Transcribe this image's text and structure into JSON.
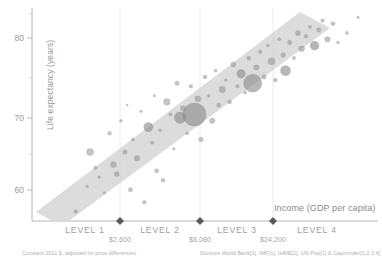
{
  "chart_data": {
    "type": "scatter",
    "title": "",
    "xlabel": "Income (GDP per capita)",
    "ylabel": "Life expectancy (years)",
    "xscale": "log",
    "xlim": [
      300,
      120000
    ],
    "ylim": [
      52,
      86
    ],
    "grid": false,
    "legend": "none",
    "yticks": [
      60,
      70,
      80
    ],
    "ytick_labels": [
      "60",
      "70",
      "80"
    ],
    "minor_yticks": [
      55,
      65,
      75,
      85
    ],
    "income_levels": [
      {
        "label": "LEVEL 1",
        "boundary_value": "$2,600",
        "boundary_x": 2600
      },
      {
        "label": "LEVEL 2",
        "boundary_value": "$8,080",
        "boundary_x": 8080
      },
      {
        "label": "LEVEL 3",
        "boundary_value": "$24,200",
        "boundary_x": 24200
      },
      {
        "label": "LEVEL 4",
        "boundary_value": "",
        "boundary_x": null
      }
    ],
    "trend_band": {
      "description": "diagonal grey band showing positive correlation between income and life expectancy",
      "color": "#c9c9c9"
    },
    "bubble_encoding": {
      "size": "population",
      "color": "#8a8a8a"
    },
    "points": [
      {
        "x": 640,
        "y": 53.5,
        "r": 2.0
      },
      {
        "x": 780,
        "y": 57.5,
        "r": 1.4
      },
      {
        "x": 820,
        "y": 63.0,
        "r": 3.6
      },
      {
        "x": 900,
        "y": 60.5,
        "r": 1.8
      },
      {
        "x": 960,
        "y": 59.0,
        "r": 1.3
      },
      {
        "x": 1050,
        "y": 56.5,
        "r": 1.2
      },
      {
        "x": 1150,
        "y": 66.0,
        "r": 2.0
      },
      {
        "x": 1230,
        "y": 61.0,
        "r": 3.0
      },
      {
        "x": 1300,
        "y": 59.5,
        "r": 2.6
      },
      {
        "x": 1400,
        "y": 68.0,
        "r": 1.5
      },
      {
        "x": 1500,
        "y": 63.0,
        "r": 2.4
      },
      {
        "x": 1560,
        "y": 70.5,
        "r": 1.1
      },
      {
        "x": 1650,
        "y": 57.0,
        "r": 2.2
      },
      {
        "x": 1720,
        "y": 65.0,
        "r": 1.6
      },
      {
        "x": 1850,
        "y": 62.0,
        "r": 2.8
      },
      {
        "x": 1980,
        "y": 69.5,
        "r": 1.4
      },
      {
        "x": 2100,
        "y": 55.0,
        "r": 1.9
      },
      {
        "x": 2250,
        "y": 67.0,
        "r": 4.6
      },
      {
        "x": 2400,
        "y": 64.5,
        "r": 1.7
      },
      {
        "x": 2500,
        "y": 72.0,
        "r": 1.3
      },
      {
        "x": 2600,
        "y": 60.0,
        "r": 2.1
      },
      {
        "x": 2750,
        "y": 66.5,
        "r": 1.5
      },
      {
        "x": 2900,
        "y": 58.5,
        "r": 2.0
      },
      {
        "x": 3100,
        "y": 71.0,
        "r": 3.4
      },
      {
        "x": 3300,
        "y": 69.0,
        "r": 1.8
      },
      {
        "x": 3500,
        "y": 63.5,
        "r": 1.4
      },
      {
        "x": 3700,
        "y": 74.0,
        "r": 2.2
      },
      {
        "x": 3900,
        "y": 68.5,
        "r": 5.8
      },
      {
        "x": 4100,
        "y": 70.0,
        "r": 2.6
      },
      {
        "x": 4400,
        "y": 66.0,
        "r": 1.6
      },
      {
        "x": 4700,
        "y": 73.5,
        "r": 1.9
      },
      {
        "x": 5000,
        "y": 69.0,
        "r": 11.5
      },
      {
        "x": 5300,
        "y": 71.5,
        "r": 3.0
      },
      {
        "x": 5600,
        "y": 65.0,
        "r": 2.4
      },
      {
        "x": 6000,
        "y": 75.0,
        "r": 2.0
      },
      {
        "x": 6400,
        "y": 72.0,
        "r": 1.5
      },
      {
        "x": 6800,
        "y": 68.0,
        "r": 2.8
      },
      {
        "x": 7200,
        "y": 76.0,
        "r": 1.7
      },
      {
        "x": 7600,
        "y": 70.5,
        "r": 2.2
      },
      {
        "x": 8080,
        "y": 73.0,
        "r": 3.2
      },
      {
        "x": 8600,
        "y": 74.5,
        "r": 1.4
      },
      {
        "x": 9200,
        "y": 71.0,
        "r": 2.0
      },
      {
        "x": 9800,
        "y": 77.0,
        "r": 2.5
      },
      {
        "x": 10500,
        "y": 73.5,
        "r": 1.8
      },
      {
        "x": 11200,
        "y": 75.5,
        "r": 4.2
      },
      {
        "x": 12000,
        "y": 72.5,
        "r": 1.6
      },
      {
        "x": 12800,
        "y": 78.0,
        "r": 2.1
      },
      {
        "x": 13700,
        "y": 74.0,
        "r": 9.0
      },
      {
        "x": 14600,
        "y": 76.5,
        "r": 2.7
      },
      {
        "x": 15600,
        "y": 79.0,
        "r": 1.9
      },
      {
        "x": 16700,
        "y": 75.0,
        "r": 2.3
      },
      {
        "x": 17800,
        "y": 80.0,
        "r": 1.5
      },
      {
        "x": 19000,
        "y": 77.5,
        "r": 3.6
      },
      {
        "x": 20300,
        "y": 74.5,
        "r": 2.0
      },
      {
        "x": 21700,
        "y": 81.0,
        "r": 1.7
      },
      {
        "x": 23200,
        "y": 78.5,
        "r": 2.4
      },
      {
        "x": 24200,
        "y": 76.0,
        "r": 5.0
      },
      {
        "x": 26000,
        "y": 80.5,
        "r": 2.2
      },
      {
        "x": 28000,
        "y": 78.0,
        "r": 1.8
      },
      {
        "x": 30000,
        "y": 82.0,
        "r": 2.6
      },
      {
        "x": 32000,
        "y": 79.5,
        "r": 3.0
      },
      {
        "x": 34500,
        "y": 81.5,
        "r": 2.0
      },
      {
        "x": 37000,
        "y": 83.0,
        "r": 1.6
      },
      {
        "x": 40000,
        "y": 80.0,
        "r": 4.4
      },
      {
        "x": 43000,
        "y": 82.5,
        "r": 2.3
      },
      {
        "x": 46000,
        "y": 84.0,
        "r": 1.9
      },
      {
        "x": 50000,
        "y": 81.0,
        "r": 2.8
      },
      {
        "x": 55000,
        "y": 83.5,
        "r": 2.1
      },
      {
        "x": 60000,
        "y": 80.5,
        "r": 1.5
      },
      {
        "x": 70000,
        "y": 82.0,
        "r": 1.7
      },
      {
        "x": 85000,
        "y": 84.5,
        "r": 1.3
      }
    ]
  },
  "axes": {
    "y_title": "Life expectancy (years)",
    "x_title": "Income (GDP per capita)",
    "y_tick_80": "80",
    "y_tick_70": "70",
    "y_tick_60": "60"
  },
  "levels": {
    "level1": "LEVEL 1",
    "level2": "LEVEL 2",
    "level3": "LEVEL 3",
    "level4": "LEVEL 4",
    "boundary1": "$2,600",
    "boundary2": "$8,080",
    "boundary3": "$24,200"
  },
  "footnotes": {
    "left": "Constant 2011 $, adjusted for price differences.",
    "right": "Sources World Bank[1], IMF[1], IHME[1], UN-Pop[1] & Gapminder[1,2,3,4]"
  }
}
